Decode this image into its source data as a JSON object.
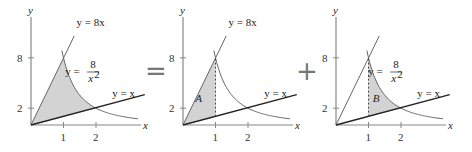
{
  "panels": [
    {
      "id": "total",
      "origin_x": 31,
      "shade": "full",
      "region_label": "",
      "labels": {
        "y_axis": "y",
        "x_axis": "x",
        "line_8x": "y = 8x",
        "curve": "y = ",
        "curve_num": "8",
        "curve_den": "x",
        "curve_exp": "2",
        "line_x": "y = x",
        "tick_y8": "8",
        "tick_y2": "2",
        "tick_x1": "1",
        "tick_x2": "2"
      },
      "show_curve_label": true
    },
    {
      "id": "A",
      "origin_x": 183,
      "shade": "A",
      "region_label": "A",
      "labels": {
        "y_axis": "y",
        "x_axis": "x",
        "line_8x": "y = 8x",
        "line_x": "y = x",
        "tick_y8": "8",
        "tick_y2": "2",
        "tick_x1": "1",
        "tick_x2": "2"
      },
      "show_curve_label": false
    },
    {
      "id": "B",
      "origin_x": 336,
      "shade": "B",
      "region_label": "B",
      "labels": {
        "y_axis": "y",
        "x_axis": "x",
        "curve": "y = ",
        "curve_num": "8",
        "curve_den": "x",
        "curve_exp": "2",
        "line_x": "y = x",
        "tick_y8": "8",
        "tick_y2": "2",
        "tick_x1": "1",
        "tick_x2": "2"
      },
      "show_curve_label": true
    }
  ],
  "operators": {
    "equals": "=",
    "plus": "+"
  },
  "colors": {
    "shade": "#d3d3d3",
    "axis": "#888888",
    "curve": "#666666",
    "line_x": "#222222"
  }
}
